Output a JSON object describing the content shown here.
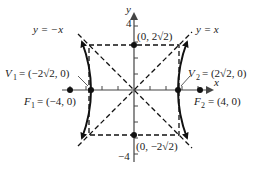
{
  "diagram": {
    "type": "hyperbola-graph",
    "equation_implied": "x^2 - y^2 = 8",
    "axes": {
      "x_label": "x",
      "y_label": "y",
      "y_tick_top": "4",
      "y_tick_bottom": "−4",
      "x_range": [
        -4,
        4
      ],
      "y_range": [
        -4,
        4
      ],
      "tick_spacing": 1
    },
    "asymptotes": [
      {
        "label": "y = −x"
      },
      {
        "label": "y = x"
      }
    ],
    "points": {
      "v1": {
        "name": "V",
        "sub": "1",
        "coords": "= (−2√2, 0)"
      },
      "v2": {
        "name": "V",
        "sub": "2",
        "coords": "= (2√2, 0)"
      },
      "f1": {
        "name": "F",
        "sub": "1",
        "coords": "= (−4, 0)"
      },
      "f2": {
        "name": "F",
        "sub": "2",
        "coords": "= (4, 0)"
      },
      "top": {
        "coords": "(0, 2√2)"
      },
      "bottom": {
        "coords": "(0, −2√2)"
      }
    },
    "colors": {
      "ink": "#111111",
      "axis": "#555555"
    }
  }
}
